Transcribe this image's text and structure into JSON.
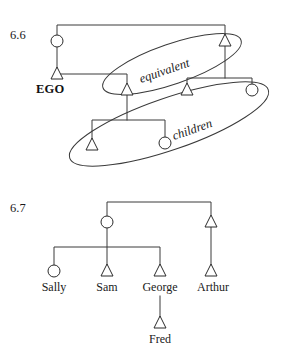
{
  "page": {
    "background_color": "#ffffff",
    "line_color": "#3a3a3a",
    "symbol_stroke_color": "#2b2b2b",
    "text_color": "#1a1a1a"
  },
  "figures": [
    {
      "id": "fig-6-6",
      "number": "6.6",
      "number_pos": {
        "x": 10,
        "y": 39
      },
      "labels": {
        "ego": "EGO",
        "equivalent": "equivalent",
        "children": "children"
      },
      "label_positions": {
        "ego": {
          "x": 36,
          "y": 92
        },
        "equivalent": {
          "x": 141,
          "y": 83,
          "rotate": -19
        },
        "children": {
          "x": 173,
          "y": 140,
          "rotate": -19
        }
      },
      "nodes": [
        {
          "name": "mother",
          "shape": "circle",
          "x": 57,
          "y": 41
        },
        {
          "name": "mothers-brother",
          "shape": "triangle",
          "x": 225,
          "y": 40
        },
        {
          "name": "ego",
          "shape": "triangle",
          "x": 57,
          "y": 73
        },
        {
          "name": "equivalent-male-left",
          "shape": "triangle",
          "x": 127,
          "y": 89
        },
        {
          "name": "equivalent-male-right",
          "shape": "triangle",
          "x": 187,
          "y": 89
        },
        {
          "name": "spouse-female",
          "shape": "circle",
          "x": 252,
          "y": 90
        },
        {
          "name": "child-male",
          "shape": "triangle",
          "x": 92,
          "y": 144
        },
        {
          "name": "child-female",
          "shape": "circle",
          "x": 165,
          "y": 143
        }
      ],
      "links": [
        {
          "name": "sibling-bar-top",
          "type": "sibling-bar",
          "x1": 57,
          "x2": 225,
          "y": 25,
          "drop_from": 41,
          "drop_to": 40
        },
        {
          "name": "descent-mother-to-ego",
          "type": "vertical",
          "x": 57,
          "y1": 47,
          "y2": 67
        },
        {
          "name": "marriage-ego-equivalent",
          "type": "horizontal",
          "x1": 57,
          "x2": 127,
          "y": 74
        },
        {
          "name": "descent-equivalent-left",
          "type": "vertical",
          "x": 127,
          "y1": 74,
          "y2": 84
        },
        {
          "name": "descent-mb-to-equivalent-right",
          "type": "vertical",
          "x": 225,
          "y1": 46,
          "y2": 78
        },
        {
          "name": "marriage-bar-right",
          "type": "horizontal",
          "x1": 187,
          "x2": 252,
          "y": 78
        },
        {
          "name": "descent-equivalent-right",
          "type": "vertical",
          "x": 187,
          "y1": 78,
          "y2": 84
        },
        {
          "name": "descent-spouse-female",
          "type": "vertical",
          "x": 252,
          "y1": 78,
          "y2": 85
        },
        {
          "name": "children-stem",
          "type": "vertical",
          "x": 127,
          "y1": 95,
          "y2": 120
        },
        {
          "name": "children-bar",
          "type": "horizontal",
          "x1": 92,
          "x2": 165,
          "y": 120
        },
        {
          "name": "children-drop-left",
          "type": "vertical",
          "x": 92,
          "y1": 120,
          "y2": 139
        },
        {
          "name": "children-drop-right",
          "type": "vertical",
          "x": 165,
          "y1": 120,
          "y2": 138
        }
      ],
      "groupings": [
        {
          "name": "equivalent-ellipse",
          "cx": 172,
          "cy": 64,
          "rx": 73,
          "ry": 20,
          "rotate": -19
        },
        {
          "name": "children-ellipse",
          "cx": 169,
          "cy": 124,
          "rx": 105,
          "ry": 26,
          "rotate": -19
        }
      ]
    },
    {
      "id": "fig-6-7",
      "number": "6.7",
      "number_pos": {
        "x": 10,
        "y": 212
      },
      "nodes": [
        {
          "name": "mother",
          "shape": "circle",
          "x": 107,
          "y": 222,
          "label": ""
        },
        {
          "name": "mothers-brother",
          "shape": "triangle",
          "x": 211,
          "y": 221,
          "label": ""
        },
        {
          "name": "sally",
          "shape": "circle",
          "x": 54,
          "y": 271,
          "label": "Sally"
        },
        {
          "name": "sam",
          "shape": "triangle",
          "x": 107,
          "y": 270,
          "label": "Sam"
        },
        {
          "name": "george",
          "shape": "triangle",
          "x": 160,
          "y": 270,
          "label": "George"
        },
        {
          "name": "arthur",
          "shape": "triangle",
          "x": 211,
          "y": 270,
          "label": "Arthur"
        },
        {
          "name": "fred",
          "shape": "triangle",
          "x": 160,
          "y": 322,
          "label": "Fred"
        }
      ],
      "label_row_y": 289,
      "fred_label_y": 341,
      "links": [
        {
          "name": "sibling-bar-top",
          "type": "sibling-bar",
          "x1": 107,
          "x2": 211,
          "y": 202,
          "drop_from": 222,
          "drop_to": 221
        },
        {
          "name": "descent-mother-stem",
          "type": "vertical",
          "x": 107,
          "y1": 228,
          "y2": 247
        },
        {
          "name": "children-bar",
          "type": "horizontal",
          "x1": 54,
          "x2": 160,
          "y": 247
        },
        {
          "name": "drop-sally",
          "type": "vertical",
          "x": 54,
          "y1": 247,
          "y2": 266
        },
        {
          "name": "drop-sam",
          "type": "vertical",
          "x": 107,
          "y1": 247,
          "y2": 265
        },
        {
          "name": "drop-george",
          "type": "vertical",
          "x": 160,
          "y1": 247,
          "y2": 265
        },
        {
          "name": "drop-arthur",
          "type": "vertical",
          "x": 211,
          "y1": 227,
          "y2": 265
        },
        {
          "name": "descent-george-to-fred",
          "type": "vertical",
          "x": 160,
          "y1": 295,
          "y2": 317
        }
      ]
    }
  ]
}
